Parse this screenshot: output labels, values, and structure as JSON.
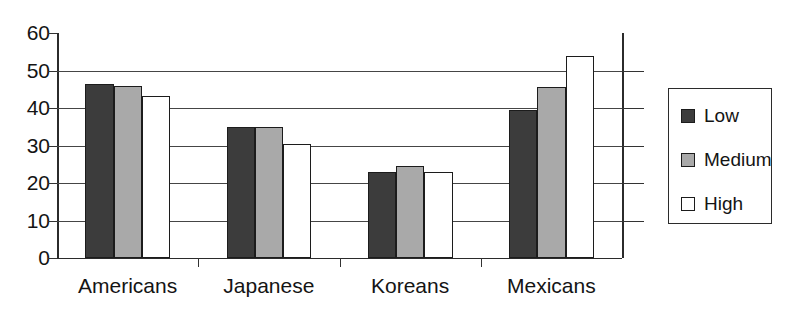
{
  "chart_data": {
    "type": "bar",
    "title": "",
    "subtitle": "",
    "xlabel": "",
    "ylabel": "",
    "categories": [
      "Americans",
      "Japanese",
      "Koreans",
      "Mexicans"
    ],
    "series": [
      {
        "name": "Low",
        "color": "#3c3c3c",
        "values": [
          46.5,
          35.0,
          23.0,
          39.5
        ]
      },
      {
        "name": "Medium",
        "color": "#a9a9a9",
        "values": [
          46.0,
          35.0,
          24.5,
          45.5
        ]
      },
      {
        "name": "High",
        "color": "#ffffff",
        "values": [
          43.3,
          30.5,
          23.0,
          54.0
        ]
      }
    ],
    "ylim": [
      0,
      60
    ],
    "yticks": [
      0,
      10,
      20,
      30,
      40,
      50,
      60
    ],
    "ytick_labels": [
      "0",
      "10",
      "20",
      "30",
      "40",
      "50",
      "60"
    ],
    "grid": true,
    "gridlines_at": [
      10,
      20,
      30,
      40,
      50
    ],
    "legend": {
      "position": "right",
      "entries": [
        {
          "label": "Low",
          "swatch": "low"
        },
        {
          "label": "Medium",
          "swatch": "medium"
        },
        {
          "label": "High",
          "swatch": "high"
        }
      ]
    }
  }
}
